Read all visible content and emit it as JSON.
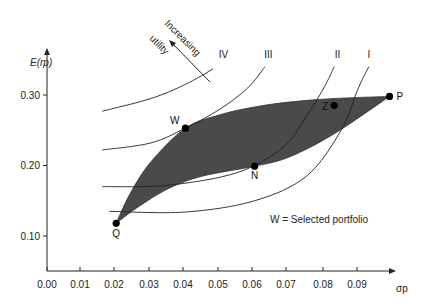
{
  "chart_data": {
    "type": "scatter",
    "title": "",
    "xlabel": "σp",
    "ylabel": "E(rp)",
    "xlim": [
      0.0,
      0.1
    ],
    "ylim": [
      0.05,
      0.35
    ],
    "x_ticks": [
      "0.00",
      "0.01",
      "0.02",
      "0.03",
      "0.04",
      "0.05",
      "0.06",
      "0.07",
      "0.08",
      "0.09"
    ],
    "x_tick_values": [
      0.0,
      0.01,
      0.02,
      0.03,
      0.04,
      0.05,
      0.06,
      0.07,
      0.08,
      0.09
    ],
    "y_ticks": [
      "0.10",
      "0.20",
      "0.30"
    ],
    "y_tick_values": [
      0.1,
      0.2,
      0.3
    ],
    "grid": false,
    "points": [
      {
        "label": "Q",
        "x": 0.02,
        "y": 0.118
      },
      {
        "label": "W",
        "x": 0.04,
        "y": 0.253
      },
      {
        "label": "N",
        "x": 0.06,
        "y": 0.199
      },
      {
        "label": "Z",
        "x": 0.083,
        "y": 0.285
      },
      {
        "label": "P",
        "x": 0.099,
        "y": 0.298
      }
    ],
    "feasible_region": {
      "upper_boundary": [
        [
          0.02,
          0.118
        ],
        [
          0.024,
          0.16
        ],
        [
          0.03,
          0.205
        ],
        [
          0.04,
          0.253
        ],
        [
          0.05,
          0.272
        ],
        [
          0.06,
          0.283
        ],
        [
          0.07,
          0.29
        ],
        [
          0.083,
          0.295
        ],
        [
          0.099,
          0.298
        ]
      ],
      "lower_boundary": [
        [
          0.02,
          0.118
        ],
        [
          0.026,
          0.14
        ],
        [
          0.035,
          0.167
        ],
        [
          0.045,
          0.185
        ],
        [
          0.06,
          0.199
        ],
        [
          0.07,
          0.212
        ],
        [
          0.083,
          0.245
        ],
        [
          0.099,
          0.298
        ]
      ]
    },
    "indifference_curves": [
      {
        "label": "I",
        "points": [
          [
            0.018,
            0.135
          ],
          [
            0.04,
            0.134
          ],
          [
            0.06,
            0.15
          ],
          [
            0.075,
            0.185
          ],
          [
            0.085,
            0.25
          ],
          [
            0.09,
            0.31
          ],
          [
            0.093,
            0.34
          ]
        ]
      },
      {
        "label": "II",
        "points": [
          [
            0.016,
            0.17
          ],
          [
            0.035,
            0.172
          ],
          [
            0.055,
            0.19
          ],
          [
            0.068,
            0.225
          ],
          [
            0.075,
            0.27
          ],
          [
            0.08,
            0.31
          ],
          [
            0.083,
            0.34
          ]
        ]
      },
      {
        "label": "III",
        "points": [
          [
            0.016,
            0.222
          ],
          [
            0.03,
            0.232
          ],
          [
            0.04,
            0.253
          ],
          [
            0.05,
            0.28
          ],
          [
            0.058,
            0.31
          ],
          [
            0.063,
            0.34
          ]
        ]
      },
      {
        "label": "IV",
        "points": [
          [
            0.016,
            0.277
          ],
          [
            0.03,
            0.295
          ],
          [
            0.04,
            0.315
          ],
          [
            0.048,
            0.337
          ]
        ]
      }
    ],
    "annotations": [
      {
        "text": "Increasing",
        "type": "arrow-label"
      },
      {
        "text": "utility",
        "type": "arrow-label"
      },
      {
        "text": "W = Selected portfolio",
        "type": "note"
      }
    ]
  }
}
